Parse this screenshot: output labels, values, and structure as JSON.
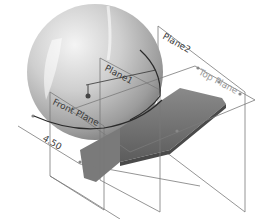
{
  "diagram": {
    "type": "cad-model-view",
    "planes": [
      {
        "id": "plane2",
        "label": "Plane2"
      },
      {
        "id": "plane1",
        "label": "Plane1"
      },
      {
        "id": "top-plane",
        "label": "Top Plane"
      },
      {
        "id": "front-plane",
        "label": "Front Plane"
      }
    ],
    "dimension": {
      "label": "4.50"
    },
    "colors": {
      "sphere_light": "#e8e8e8",
      "sphere_dark": "#8c8c8c",
      "body_dark": "#6e6e6e",
      "plane_edge": "#7a7a7a"
    }
  }
}
